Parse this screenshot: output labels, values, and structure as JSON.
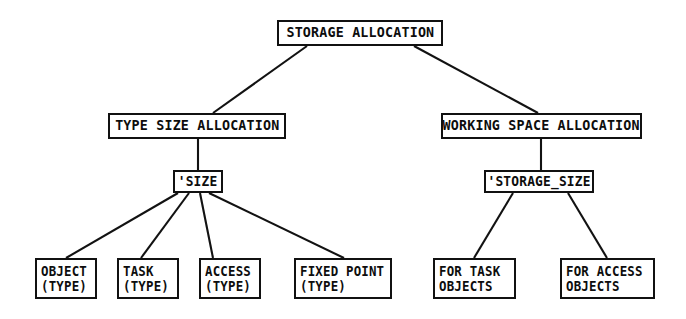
{
  "diagram": {
    "title": "Storage Allocation",
    "type": "hierarchy-tree",
    "background_color": "#ffffff",
    "line_color": "#121212",
    "text_color": "#0d0d0d",
    "nodes": [
      {
        "id": "root",
        "label": "STORAGE ALLOCATION",
        "lines": [
          "STORAGE ALLOCATION"
        ],
        "level": 0,
        "x": 277,
        "y": 20,
        "w": 166,
        "h": 26,
        "font_size": 14.5
      },
      {
        "id": "type-size-allocation",
        "label": "TYPE SIZE ALLOCATION",
        "lines": [
          "TYPE SIZE ALLOCATION"
        ],
        "level": 1,
        "x": 108,
        "y": 113,
        "w": 178,
        "h": 26,
        "font_size": 14.5
      },
      {
        "id": "working-space-allocation",
        "label": "WORKING SPACE ALLOCATION",
        "lines": [
          "WORKING SPACE ALLOCATION"
        ],
        "level": 1,
        "x": 441,
        "y": 113,
        "w": 201,
        "h": 26,
        "font_size": 14.5
      },
      {
        "id": "size-attribute",
        "label": "'SIZE",
        "lines": [
          "'SIZE"
        ],
        "level": 2,
        "x": 173,
        "y": 170,
        "w": 50,
        "h": 23,
        "font_size": 14
      },
      {
        "id": "storage-size-attribute",
        "label": "'STORAGE_SIZE",
        "lines": [
          "'STORAGE_SIZE"
        ],
        "level": 2,
        "x": 484,
        "y": 170,
        "w": 110,
        "h": 23,
        "font_size": 14
      },
      {
        "id": "object-type",
        "label": "OBJECT (TYPE)",
        "lines": [
          "OBJECT",
          "(TYPE)"
        ],
        "level": 3,
        "x": 35,
        "y": 258,
        "w": 62,
        "h": 41,
        "font_size": 13.5
      },
      {
        "id": "task-type",
        "label": "TASK (TYPE)",
        "lines": [
          "TASK",
          "(TYPE)"
        ],
        "level": 3,
        "x": 117,
        "y": 258,
        "w": 62,
        "h": 41,
        "font_size": 13.5
      },
      {
        "id": "access-type",
        "label": "ACCESS (TYPE)",
        "lines": [
          "ACCESS",
          "(TYPE)"
        ],
        "level": 3,
        "x": 199,
        "y": 258,
        "w": 62,
        "h": 41,
        "font_size": 13.5
      },
      {
        "id": "fixed-point-type",
        "label": "FIXED POINT (TYPE)",
        "lines": [
          "FIXED POINT",
          "(TYPE)"
        ],
        "level": 3,
        "x": 294,
        "y": 258,
        "w": 98,
        "h": 41,
        "font_size": 13.5
      },
      {
        "id": "for-task-objects",
        "label": "FOR TASK OBJECTS",
        "lines": [
          "FOR TASK",
          "OBJECTS"
        ],
        "level": 3,
        "x": 433,
        "y": 258,
        "w": 83,
        "h": 41,
        "font_size": 13.5
      },
      {
        "id": "for-access-objects",
        "label": "FOR ACCESS OBJECTS",
        "lines": [
          "FOR ACCESS",
          "OBJECTS"
        ],
        "level": 3,
        "x": 560,
        "y": 258,
        "w": 95,
        "h": 41,
        "font_size": 13.5
      }
    ],
    "edges": [
      {
        "id": "root-to-type-size",
        "from": "root",
        "to": "type-size-allocation",
        "x1": 307,
        "y1": 46,
        "x2": 213,
        "y2": 113
      },
      {
        "id": "root-to-working-space",
        "from": "root",
        "to": "working-space-allocation",
        "x1": 414,
        "y1": 46,
        "x2": 538,
        "y2": 113
      },
      {
        "id": "type-size-to-size",
        "from": "type-size-allocation",
        "to": "size-attribute",
        "x1": 198,
        "y1": 139,
        "x2": 198,
        "y2": 170
      },
      {
        "id": "working-space-to-storage-size",
        "from": "working-space-allocation",
        "to": "storage-size-attribute",
        "x1": 541,
        "y1": 139,
        "x2": 541,
        "y2": 170
      },
      {
        "id": "size-to-object",
        "from": "size-attribute",
        "to": "object-type",
        "x1": 178,
        "y1": 193,
        "x2": 66,
        "y2": 258
      },
      {
        "id": "size-to-task",
        "from": "size-attribute",
        "to": "task-type",
        "x1": 189,
        "y1": 193,
        "x2": 141,
        "y2": 258
      },
      {
        "id": "size-to-access",
        "from": "size-attribute",
        "to": "access-type",
        "x1": 200,
        "y1": 193,
        "x2": 213,
        "y2": 258
      },
      {
        "id": "size-to-fixed-point",
        "from": "size-attribute",
        "to": "fixed-point-type",
        "x1": 209,
        "y1": 193,
        "x2": 344,
        "y2": 258
      },
      {
        "id": "storage-size-to-for-task",
        "from": "storage-size-attribute",
        "to": "for-task-objects",
        "x1": 513,
        "y1": 193,
        "x2": 474,
        "y2": 258
      },
      {
        "id": "storage-size-to-for-access",
        "from": "storage-size-attribute",
        "to": "for-access-objects",
        "x1": 568,
        "y1": 193,
        "x2": 607,
        "y2": 258
      }
    ]
  }
}
